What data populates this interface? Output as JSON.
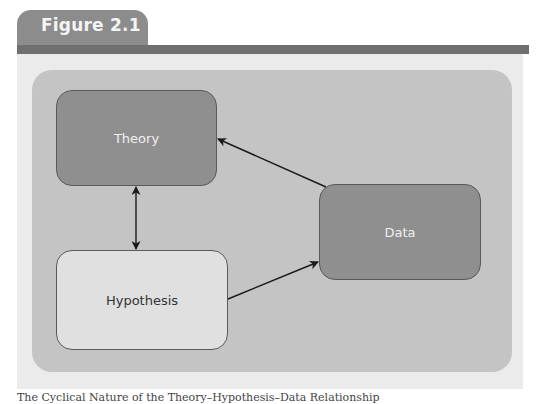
{
  "figure": {
    "tab_label": "Figure 2.1",
    "caption": "The Cyclical Nature of the Theory–Hypothesis–Data Relationship"
  },
  "colors": {
    "tab": "#8c8c8c",
    "bar": "#6f6f6f",
    "outer_panel": "#ebebeb",
    "inner_panel": "#c4c4c4",
    "dark_node": "#8f8f8f",
    "light_node": "#e0e0e0",
    "arrow": "#1a1a1a"
  },
  "diagram": {
    "nodes": [
      {
        "id": "theory",
        "label": "Theory",
        "style": "dark"
      },
      {
        "id": "hypothesis",
        "label": "Hypothesis",
        "style": "light"
      },
      {
        "id": "data",
        "label": "Data",
        "style": "dark"
      }
    ],
    "edges": [
      {
        "from": "theory",
        "to": "hypothesis",
        "direction": "bidirectional"
      },
      {
        "from": "hypothesis",
        "to": "data",
        "direction": "forward"
      },
      {
        "from": "data",
        "to": "theory",
        "direction": "forward"
      }
    ]
  }
}
